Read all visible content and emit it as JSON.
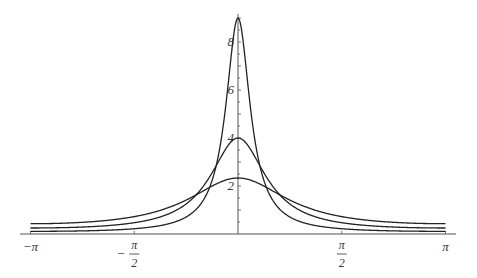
{
  "chart_data": {
    "type": "line",
    "title": "",
    "xlabel": "",
    "ylabel": "",
    "xlim": [
      -3.14159,
      3.14159
    ],
    "ylim": [
      0,
      9.3
    ],
    "grid": false,
    "legend": null,
    "x_ticks": [
      {
        "value": -3.14159,
        "label": "−π"
      },
      {
        "value": -1.5708,
        "label_num": "π",
        "label_den": "2",
        "sign": "−"
      },
      {
        "value": 1.5708,
        "label_num": "π",
        "label_den": "2",
        "sign": ""
      },
      {
        "value": 3.14159,
        "label": "π"
      }
    ],
    "y_ticks": [
      {
        "value": 2,
        "label": "2"
      },
      {
        "value": 4,
        "label": "4"
      },
      {
        "value": 6,
        "label": "6"
      },
      {
        "value": 8,
        "label": "8"
      }
    ],
    "series": [
      {
        "name": "Poisson kernel r=0.4",
        "r": 0.4,
        "peak": 2.33,
        "endpoint": 0.43
      },
      {
        "name": "Poisson kernel r=0.6",
        "r": 0.6,
        "peak": 4.0,
        "endpoint": 0.25
      },
      {
        "name": "Poisson kernel r=0.8",
        "r": 0.8,
        "peak": 9.0,
        "endpoint": 0.11
      }
    ],
    "formula": "P_r(θ) = (1 − r²) / (1 − 2r cos θ + r²)"
  },
  "colors": {
    "curve": "#222222",
    "axis": "#555555"
  }
}
